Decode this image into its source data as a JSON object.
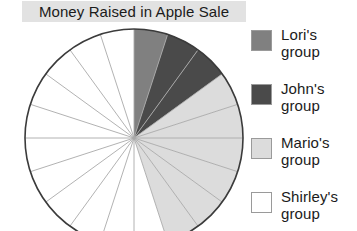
{
  "title": "Money Raised in Apple Sale",
  "colors": {
    "lori": "#808080",
    "john": "#4a4a4a",
    "mario": "#dcdcdc",
    "shirley": "#ffffff",
    "outline": "#3b3b3b",
    "spoke": "#a9a9a9",
    "title_bg": "#e2e2e2",
    "text": "#1b1b1b"
  },
  "legend": {
    "items": [
      {
        "name": "Lori's",
        "line2": "group",
        "color": "#808080",
        "swatch": "lori-swatch"
      },
      {
        "name": "John's",
        "line2": "group",
        "color": "#4a4a4a",
        "swatch": "john-swatch"
      },
      {
        "name": "Mario's",
        "line2": "group",
        "color": "#dcdcdc",
        "swatch": "mario-swatch"
      },
      {
        "name": "Shirley's",
        "line2": "group",
        "color": "#ffffff",
        "swatch": "shirley-swatch"
      }
    ]
  },
  "chart_data": {
    "type": "pie",
    "title": "Money Raised in Apple Sale",
    "total_wedges": 20,
    "wedge_degrees": 18,
    "start_angle_deg": 0,
    "direction": "clockwise",
    "categories": [
      "Lori's group",
      "John's group",
      "Mario's group",
      "Shirley's group"
    ],
    "values": [
      1,
      2,
      6,
      11
    ],
    "percentages": [
      5,
      10,
      30,
      55
    ],
    "colors": [
      "#808080",
      "#4a4a4a",
      "#dcdcdc",
      "#ffffff"
    ],
    "legend_position": "right",
    "grid": false
  }
}
